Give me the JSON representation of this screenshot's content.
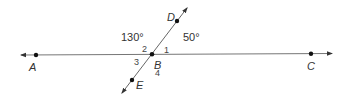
{
  "diagram": {
    "type": "geometry-intersecting-lines",
    "lines": [
      {
        "name": "line AC",
        "through": [
          "A",
          "B",
          "C"
        ],
        "arrows": "both"
      },
      {
        "name": "line DE",
        "through": [
          "D",
          "B",
          "E"
        ],
        "arrows": "both"
      }
    ],
    "points": {
      "A": {
        "label": "A",
        "x": 36,
        "y": 55
      },
      "B": {
        "label": "B",
        "x": 152,
        "y": 54
      },
      "C": {
        "label": "C",
        "x": 311,
        "y": 54
      },
      "D": {
        "label": "D",
        "x": 177,
        "y": 21
      },
      "E": {
        "label": "E",
        "x": 132,
        "y": 80
      }
    },
    "angle_numbers": {
      "a1": "1",
      "a2": "2",
      "a3": "3",
      "a4": "4"
    },
    "angle_measures": {
      "left_top": "130°",
      "right_top": "50°"
    },
    "colors": {
      "line": "#555555",
      "point": "#111111",
      "text": "#333333"
    }
  }
}
